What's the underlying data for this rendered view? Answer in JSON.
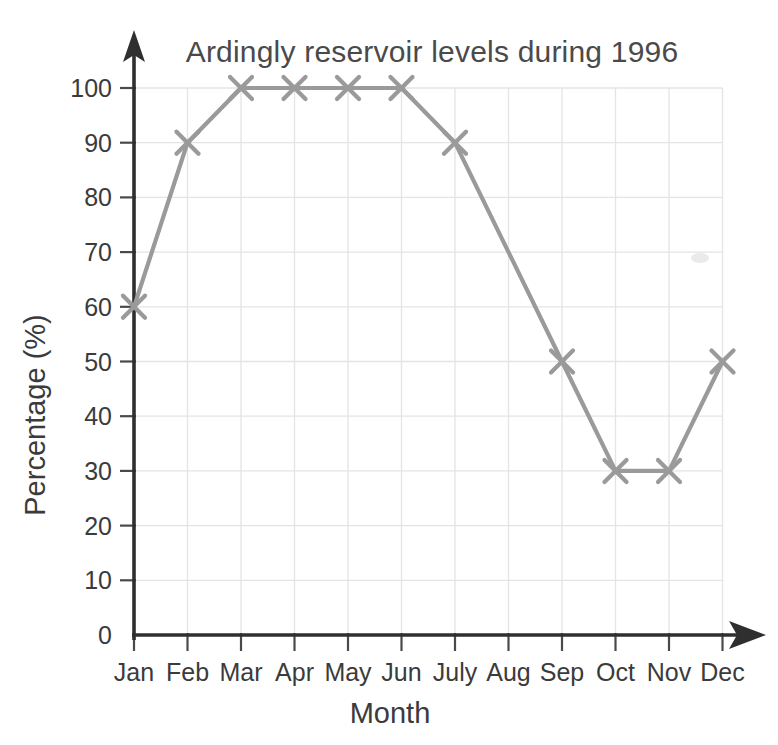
{
  "chart_data": {
    "type": "line",
    "title": "Ardingly reservoir levels during 1996",
    "xlabel": "Month",
    "ylabel": "Percentage (%)",
    "categories": [
      "Jan",
      "Feb",
      "Mar",
      "Apr",
      "May",
      "Jun",
      "July",
      "Aug",
      "Sep",
      "Oct",
      "Nov",
      "Dec"
    ],
    "values": [
      60,
      90,
      100,
      100,
      100,
      100,
      90,
      null,
      50,
      30,
      30,
      50
    ],
    "markers": [
      {
        "category": "Jan",
        "value": 60,
        "marker": true
      },
      {
        "category": "Feb",
        "value": 90,
        "marker": true
      },
      {
        "category": "Mar",
        "value": 100,
        "marker": true
      },
      {
        "category": "Apr",
        "value": 100,
        "marker": true
      },
      {
        "category": "May",
        "value": 100,
        "marker": true
      },
      {
        "category": "Jun",
        "value": 100,
        "marker": true
      },
      {
        "category": "July",
        "value": 90,
        "marker": true
      },
      {
        "category": "Aug",
        "value": 70,
        "marker": false
      },
      {
        "category": "Sep",
        "value": 50,
        "marker": true
      },
      {
        "category": "Oct",
        "value": 30,
        "marker": true
      },
      {
        "category": "Nov",
        "value": 30,
        "marker": true
      },
      {
        "category": "Dec",
        "value": 50,
        "marker": true
      }
    ],
    "ylim": [
      0,
      100
    ],
    "ytick_step": 10,
    "yticks": [
      0,
      10,
      20,
      30,
      40,
      50,
      60,
      70,
      80,
      90,
      100
    ],
    "ytick_labels": [
      "0",
      "10",
      "20",
      "30",
      "40",
      "50",
      "60",
      "70",
      "80",
      "90",
      "100"
    ],
    "grid": true,
    "legend": null,
    "marker_symbol": "x",
    "series_color": "#9a9a9a",
    "grid_color": "#e4e4e4",
    "axis_color": "#2f2f2f",
    "text_color": "#3b3b3b"
  }
}
